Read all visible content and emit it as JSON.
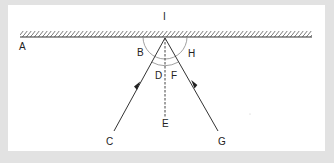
{
  "diagram": {
    "labels": {
      "I": "I",
      "A": "A",
      "B": "B",
      "H": "H",
      "D": "D",
      "F": "F",
      "E": "E",
      "C": "C",
      "G": "G"
    },
    "elements": {
      "mirror": "plane mirror surface (hatched)",
      "normal": "dashed normal line from incidence point to E",
      "incident_ray": "ray from C to point of incidence (arrow pointing up)",
      "reflected_ray": "ray from point of incidence to G (arrow pointing down)",
      "outer_arc": "angles B and H between rays and mirror",
      "inner_arc": "angles D and F between rays and normal"
    },
    "colors": {
      "frame": "#e2e2e2",
      "panel": "#ffffff",
      "lines": "#333333",
      "arcs": "#888888"
    }
  }
}
